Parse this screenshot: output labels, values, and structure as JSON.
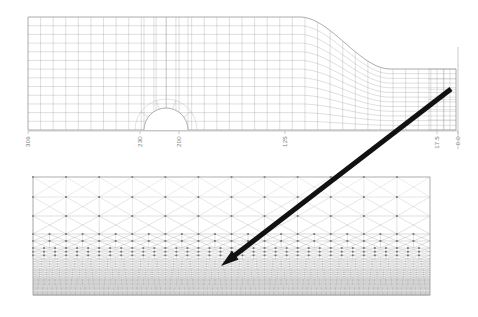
{
  "figure": {
    "background_color": "#ffffff"
  },
  "top_panel": {
    "name": "tunnel-slope-mesh",
    "description": "Structured quadrilateral finite element mesh of a soil profile containing a circular tunnel opening on the left and a descending ground slope on the right",
    "mesh_color": "#9a9a9a",
    "boundary_color": "#8a8a8a",
    "bounds": {
      "x": 28,
      "y": 17,
      "width": 428,
      "height": 113
    },
    "tunnel": {
      "name": "tunnel-opening",
      "center_x": 166,
      "center_y": 128,
      "radius": 22
    },
    "slope": {
      "crest_x": 300,
      "crest_y": 17,
      "toe_x": 390,
      "toe_y": 69
    }
  },
  "axis": {
    "name": "horizontal-distance-axis",
    "orientation": "horizontal",
    "tick_label_rotation": -90,
    "line_color": "#a8a8a8",
    "ticks": [
      {
        "label": "306",
        "x": 28
      },
      {
        "label": "230",
        "x": 140
      },
      {
        "label": "200",
        "x": 179
      },
      {
        "label": "125",
        "x": 285
      },
      {
        "label": "17.5",
        "x": 437
      },
      {
        "label": "0.0",
        "x": 458
      }
    ]
  },
  "bottom_panel": {
    "name": "refined-triangulated-mesh-detail",
    "description": "Zoomed detail of the mesh showing criss-cross triangulated quadrilateral cells that refine progressively with depth into a dense dark grey lattice",
    "bounds": {
      "x": 33,
      "y": 177,
      "width": 397,
      "height": 118
    },
    "coarse_color": "#b4b4b4",
    "dense_color": "#8d8d8d",
    "node_color": "#6f6f6f",
    "columns": 12,
    "coarse_rows": 4,
    "refine_levels": 4
  },
  "annotation_arrow": {
    "name": "detail-callout-arrow",
    "color": "#111111",
    "tail_x": 451,
    "tail_y": 89,
    "tip_x": 221,
    "tip_y": 266,
    "thickness": 5
  }
}
